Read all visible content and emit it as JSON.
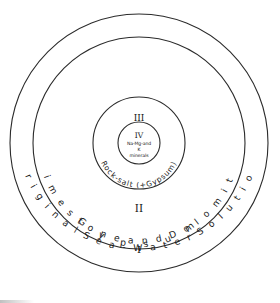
{
  "diagram": {
    "type": "concentric-rings",
    "geometry": {
      "center_x": 139,
      "center_y": 143,
      "radii": [
        129,
        106,
        46,
        21
      ]
    },
    "stroke_color": "#2b2b2b",
    "background_color": "#ffffff",
    "zones": [
      {
        "numeral": "I",
        "name": "Limestone and Dolomite",
        "ring_label": "L i m e s t o n e   a n d   D o l o m i t e",
        "numeral_x": 139,
        "numeral_y": 253
      },
      {
        "numeral": "II",
        "name": "Gypsum",
        "ring_label": "G y p s u m",
        "numeral_x": 139,
        "numeral_y": 212
      },
      {
        "numeral": "III",
        "name": "Rock-salt (+Gypsum)",
        "ring_label": "Rock-salt (+Gypsum)",
        "numeral_x": 139,
        "numeral_y": 121
      },
      {
        "numeral": "IV",
        "name": "Na-Mg-and K minerals",
        "ring_label": "Na-Mg-and K minerals",
        "numeral_x": 139,
        "numeral_y": 138
      }
    ],
    "outer_ring": {
      "label": "O r i g i n a l   S e a - W a t e r   S o l u t i o n"
    },
    "core": {
      "line1": "Na-Mg-and",
      "line2": "K",
      "line3": "minerals"
    }
  }
}
